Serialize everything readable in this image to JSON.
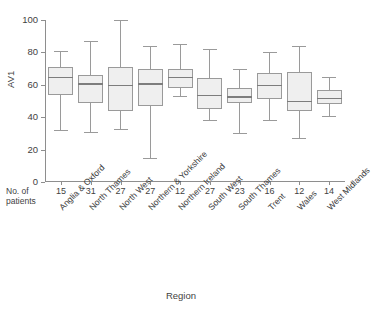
{
  "chart_data": {
    "type": "boxplot",
    "title": "",
    "xlabel": "Region",
    "ylabel": "AV1",
    "ylim": [
      0,
      100
    ],
    "yticks": [
      0,
      20,
      40,
      60,
      80,
      100
    ],
    "grid": false,
    "legend": null,
    "categories": [
      "Anglia & Oxford",
      "North Thames",
      "North West",
      "Northern & Yorkshire",
      "Northern Ireland",
      "South West",
      "South Thames",
      "Trent",
      "Wales",
      "West Midlands"
    ],
    "counts_label_line1": "No. of",
    "counts_label_line2": "patients",
    "counts": [
      15,
      31,
      27,
      27,
      12,
      27,
      23,
      16,
      12,
      14
    ],
    "boxes": [
      {
        "category": "Anglia & Oxford",
        "whisker_low": 32,
        "q1": 54,
        "median": 65,
        "q3": 71,
        "whisker_high": 81
      },
      {
        "category": "North Thames",
        "whisker_low": 31,
        "q1": 49,
        "median": 61,
        "q3": 66,
        "whisker_high": 87
      },
      {
        "category": "North West",
        "whisker_low": 33,
        "q1": 44,
        "median": 60,
        "q3": 71,
        "whisker_high": 100
      },
      {
        "category": "Northern & Yorkshire",
        "whisker_low": 15,
        "q1": 47,
        "median": 61,
        "q3": 70,
        "whisker_high": 84
      },
      {
        "category": "Northern Ireland",
        "whisker_low": 53,
        "q1": 58,
        "median": 65,
        "q3": 70,
        "whisker_high": 85
      },
      {
        "category": "South West",
        "whisker_low": 38,
        "q1": 45,
        "median": 54,
        "q3": 64,
        "whisker_high": 82
      },
      {
        "category": "South Thames",
        "whisker_low": 30,
        "q1": 49,
        "median": 53,
        "q3": 58,
        "whisker_high": 70
      },
      {
        "category": "Trent",
        "whisker_low": 38,
        "q1": 51,
        "median": 60,
        "q3": 67,
        "whisker_high": 80
      },
      {
        "category": "Wales",
        "whisker_low": 27,
        "q1": 44,
        "median": 50,
        "q3": 68,
        "whisker_high": 84
      },
      {
        "category": "West Midlands",
        "whisker_low": 41,
        "q1": 48,
        "median": 52,
        "q3": 57,
        "whisker_high": 65
      }
    ],
    "colors": {
      "box_fill": "#efefef",
      "box_stroke": "#9a9a9a",
      "median": "#7d7d7d",
      "axis": "#8e8e8e",
      "text": "#3f3f3f",
      "background": "#ffffff"
    }
  }
}
